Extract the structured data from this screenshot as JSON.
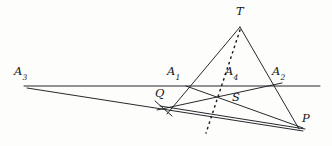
{
  "figure": {
    "width": 332,
    "height": 146,
    "background_color": "#fdfdfc",
    "stroke_color": "#1a1c20",
    "stroke_width": 0.9,
    "dotted_stroke_color": "#1a1c20"
  },
  "labels": {
    "A3": {
      "base": "A",
      "sub": "3",
      "x": 14,
      "y": 66
    },
    "A1": {
      "base": "A",
      "sub": "1",
      "x": 167,
      "y": 66
    },
    "A4": {
      "base": "A",
      "sub": "4",
      "x": 225,
      "y": 66
    },
    "A2": {
      "base": "A",
      "sub": "2",
      "x": 272,
      "y": 66
    },
    "T": {
      "base": "T",
      "sub": "",
      "x": 236,
      "y": 6
    },
    "Q": {
      "base": "Q",
      "sub": "",
      "x": 155,
      "y": 88
    },
    "S": {
      "base": "S",
      "sub": "",
      "x": 232,
      "y": 92
    },
    "P": {
      "base": "P",
      "sub": "",
      "x": 302,
      "y": 113
    }
  },
  "points": {
    "A3": {
      "x": 28,
      "y": 87
    },
    "A1": {
      "x": 186,
      "y": 86
    },
    "A4": {
      "x": 222,
      "y": 86
    },
    "A2": {
      "x": 273,
      "y": 86
    },
    "T": {
      "x": 240,
      "y": 27
    },
    "Q": {
      "x": 163,
      "y": 108
    },
    "S": {
      "x": 214,
      "y": 99
    },
    "P": {
      "x": 297,
      "y": 126
    }
  },
  "segments": {
    "horizontal_axis": {
      "name": "line-A3-A1-A4-A2",
      "x1": 24,
      "y1": 86,
      "x2": 320,
      "y2": 86
    },
    "T_to_A1_side": {
      "name": "line-T-A1-Q",
      "x1": 240,
      "y1": 27,
      "x2": 167,
      "y2": 114
    },
    "T_to_A2_side": {
      "name": "line-T-A2-P",
      "x1": 240,
      "y1": 27,
      "x2": 299,
      "y2": 129
    },
    "A3_to_P": {
      "name": "line-A3-Q-P",
      "x1": 27,
      "y1": 88,
      "x2": 303,
      "y2": 131
    },
    "Q_to_A2": {
      "name": "line-Q-S-A2",
      "x1": 157,
      "y1": 110,
      "x2": 281,
      "y2": 83
    },
    "Q_to_P_lower": {
      "name": "line-Q-P",
      "x1": 160,
      "y1": 106,
      "x2": 304,
      "y2": 129
    },
    "A1_to_P": {
      "name": "line-A1-S-P",
      "x1": 186,
      "y1": 86,
      "x2": 303,
      "y2": 128
    },
    "tick_through_Q": {
      "name": "tick-mark-at-Q",
      "x1": 155,
      "y1": 101,
      "x2": 172,
      "y2": 116
    }
  },
  "dotted_cevian": {
    "name": "dotted-line-T-A4",
    "x1": 240,
    "y1": 30,
    "x2": 206,
    "y2": 133,
    "dash_pattern": "1.3 4.4"
  }
}
